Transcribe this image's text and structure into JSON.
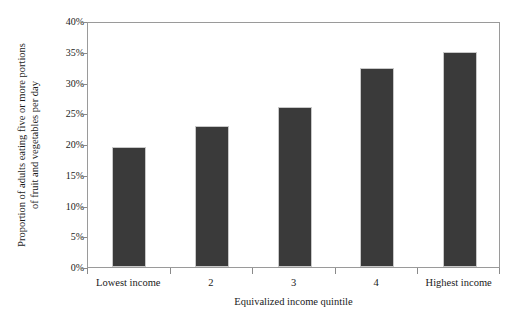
{
  "chart_data": {
    "type": "bar",
    "title": "",
    "subtitle": "",
    "xlabel": "Equivalized income quintile",
    "ylabel": "Proportion of adults eating five or more portions of fruit and vegetables per day",
    "ylabel_lines": [
      "Proportion of adults eating five or more portions",
      "of fruit and vegetables per day"
    ],
    "categories": [
      "Lowest income",
      "2",
      "3",
      "4",
      "Highest income"
    ],
    "values": [
      19.5,
      23.0,
      26.0,
      32.4,
      35.0
    ],
    "series": [
      {
        "name": "Proportion of adults eating five or more portions of fruit and vegetables per day",
        "values": [
          19.5,
          23.0,
          26.0,
          32.4,
          35.0
        ]
      }
    ],
    "ylim": [
      0,
      40
    ],
    "ytick_values": [
      0,
      5,
      10,
      15,
      20,
      25,
      30,
      35,
      40
    ],
    "ytick_labels": [
      "0%",
      "5%",
      "10%",
      "15%",
      "20%",
      "25%",
      "30%",
      "35%",
      "40%"
    ],
    "grid": false,
    "legend": "none",
    "bar_color": "#3a3a3a",
    "bar_edge_color": "#c8c8c8",
    "axis_color": "#9a9a9a",
    "background_color": "#ffffff"
  }
}
